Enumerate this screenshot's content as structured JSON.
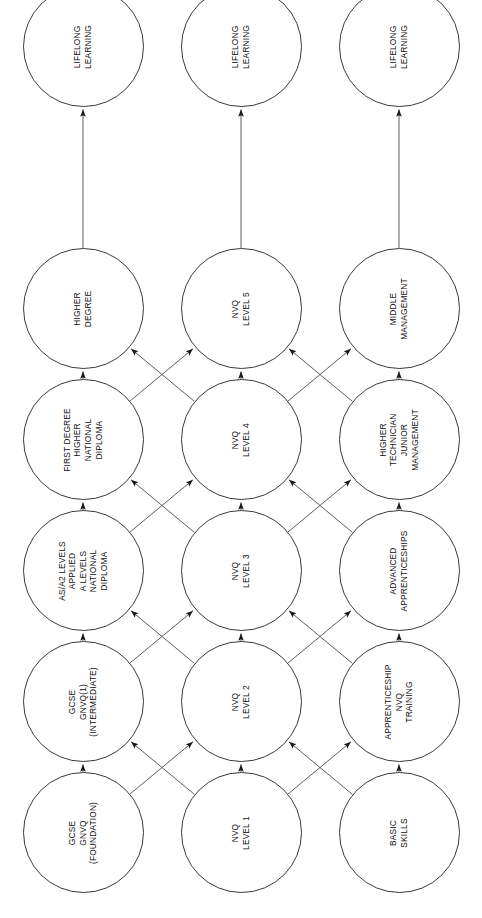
{
  "diagram": {
    "orientation": "rotated-90-ccw",
    "rows": 3,
    "columns": 7,
    "node_diameter_px": 121,
    "column_centers_px": [
      85,
      216,
      347,
      478,
      609,
      740,
      871
    ],
    "row_centers_px": [
      83,
      241,
      399
    ],
    "stroke_color": "#3a3a3a",
    "text_color": "#111111",
    "background_color": "#ffffff"
  },
  "chart_data": {
    "type": "diagram",
    "rows": [
      {
        "name": "academic",
        "nodes": [
          "GCSE\nGNVQ\n(FOUNDATION)",
          "GCSE\nGNVQ(1)\n(INTERMEDIATE)",
          "AS/A2 LEVELS\nAPPLIED\nA LEVELS\nNATIONAL\nDIPLOMA",
          "FIRST DEGREE\nHIGHER\nNATIONAL\nDIPLOMA",
          "HIGHER\nDEGREE",
          "LIFELONG\nLEARNING"
        ]
      },
      {
        "name": "vocational",
        "nodes": [
          "NVQ\nLEVEL 1",
          "NVQ\nLEVEL 2",
          "NVQ\nLEVEL 3",
          "NVQ\nLEVEL 4",
          "NVQ\nLEVEL 5",
          "LIFELONG\nLEARNING"
        ]
      },
      {
        "name": "workbased",
        "nodes": [
          "BASIC\nSKILLS",
          "APPRENTICESHIP\nNVQ\nTRAINING",
          "ADVANCED\nAPPRENTICESHIPS",
          "HIGHER\nTECHNICIAN\nJUNIOR\nMANAGEMENT",
          "MIDDLE\nMANAGEMENT",
          "LIFELONG\nLEARNING"
        ]
      }
    ],
    "edges": {
      "horizontal": "Each node points to the node immediately to its right within the same row.",
      "diagonal": "Between every adjacent pair of columns, nodes cross-connect diagonally between adjacent rows forming X patterns (row1<->row2 and row2<->row3).",
      "arrowheads": "single, pointing toward the later (rightward) column"
    }
  },
  "nodes": {
    "r0c0": "GCSE\nGNVQ\n(FOUNDATION)",
    "r0c1": "GCSE\nGNVQ(1)\n(INTERMEDIATE)",
    "r0c2": "AS/A2 LEVELS\nAPPLIED\nA LEVELS\nNATIONAL\nDIPLOMA",
    "r0c3": "FIRST DEGREE\nHIGHER\nNATIONAL\nDIPLOMA",
    "r0c4": "HIGHER\nDEGREE",
    "r0c5": "LIFELONG\nLEARNING",
    "r1c0": "NVQ\nLEVEL 1",
    "r1c1": "NVQ\nLEVEL 2",
    "r1c2": "NVQ\nLEVEL 3",
    "r1c3": "NVQ\nLEVEL 4",
    "r1c4": "NVQ\nLEVEL 5",
    "r1c5": "LIFELONG\nLEARNING",
    "r2c0": "BASIC\nSKILLS",
    "r2c1": "APPRENTICESHIP\nNVQ\nTRAINING",
    "r2c2": "ADVANCED\nAPPRENTICESHIPS",
    "r2c3": "HIGHER\nTECHNICIAN\nJUNIOR\nMANAGEMENT",
    "r2c4": "MIDDLE\nMANAGEMENT",
    "r2c5": "LIFELONG\nLEARNING"
  }
}
